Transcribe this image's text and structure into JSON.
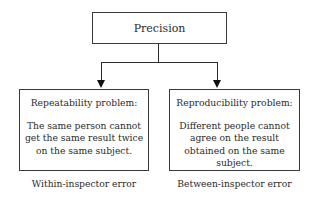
{
  "diagram": {
    "root": {
      "label": "Precision"
    },
    "children": [
      {
        "title": "Repeatability problem:",
        "description": "The same person cannot get the same result twice on the same subject.",
        "caption": "Within-inspector error"
      },
      {
        "title": "Reproducibility problem:",
        "description": "Different people cannot agree on the result obtained on the same subject.",
        "caption": "Between-inspector error"
      }
    ],
    "edges": [
      {
        "from": "Precision",
        "to": "Repeatability problem"
      },
      {
        "from": "Precision",
        "to": "Reproducibility problem"
      }
    ]
  }
}
